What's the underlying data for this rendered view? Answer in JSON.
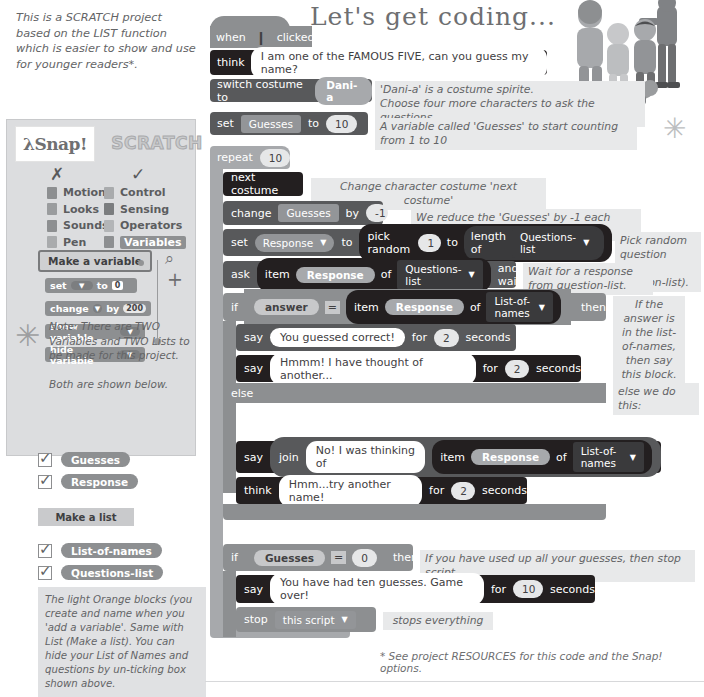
{
  "intro": {
    "text": "This is a SCRATCH project based on the LIST function which is easier to show and use for younger readers*."
  },
  "title": "Let's get coding...",
  "snap_panel": {
    "snap_logo": "λSnap!",
    "scratch_logo": "SCRATCH",
    "mark_x": "✗",
    "mark_tick": "✓",
    "categories_left": [
      {
        "label": "Motion",
        "color": "#8d8f91"
      },
      {
        "label": "Looks",
        "color": "#9a9c9e"
      },
      {
        "label": "Sounds",
        "color": "#8d8f91"
      },
      {
        "label": "Pen",
        "color": "#a9abad"
      }
    ],
    "categories_right": [
      {
        "label": "Control",
        "color": "#a9abad",
        "highlight": false
      },
      {
        "label": "Sensing",
        "color": "#7b7d7f",
        "highlight": false
      },
      {
        "label": "Operators",
        "color": "#b3b5b7",
        "highlight": false
      },
      {
        "label": "Variables",
        "color": "#8d8f91",
        "highlight": true
      }
    ],
    "make_a_variable": "Make a variable",
    "palette_blocks": [
      {
        "label": "set",
        "slot": true,
        "mid": "to",
        "value": "0",
        "rounded": false
      },
      {
        "label": "change",
        "slot": true,
        "mid": "by",
        "value": "200",
        "rounded": true
      },
      {
        "label": "show variable",
        "slot": false,
        "mid": "",
        "value": "",
        "rounded": false
      },
      {
        "label": "hide variable",
        "slot": false,
        "mid": "",
        "value": "",
        "rounded": false
      }
    ],
    "magnifier_icon": "⌕",
    "plus_icon": "+",
    "asterisk": "✳",
    "note": "Note: There are TWO Variables and TWO Lists to be made for this project.\n\nBoth are shown below."
  },
  "variables_list": [
    {
      "label": "Guesses",
      "checked": true
    },
    {
      "label": "Response",
      "checked": true
    }
  ],
  "make_a_list": "Make a list",
  "lists_list": [
    {
      "label": "List-of-names",
      "checked": true
    },
    {
      "label": "Questions-list",
      "checked": true
    }
  ],
  "orange_note": "The light Orange blocks (you create and name when you 'add a variable'. Same with List (Make a list). You can hide your List of Names and questions by un-ticking box shown above.",
  "script": {
    "hat": {
      "when": "when",
      "flag": "⚑",
      "clicked": "clicked"
    },
    "think1": {
      "label": "think",
      "text": "I am one of the FAMOUS FIVE, can you guess my name?"
    },
    "switch_costume": {
      "label": "switch costume to",
      "value": "Dani-a"
    },
    "set_guesses": {
      "label": "set",
      "var": "Guesses",
      "to": "to",
      "value": "10"
    },
    "repeat": {
      "label": "repeat",
      "value": "10"
    },
    "next_costume": {
      "label": "next costume"
    },
    "change_guesses": {
      "label": "change",
      "var": "Guesses",
      "by": "by",
      "value": "-1"
    },
    "set_response": {
      "label": "set",
      "var": "Response",
      "to": "to",
      "pick": "pick random",
      "from": "1",
      "mid": "to",
      "length_of": "length of",
      "list": "Questions-list"
    },
    "ask": {
      "label": "ask",
      "item": "item",
      "var": "Response",
      "of": "of",
      "list": "Questions-list",
      "and_wait": "and wait"
    },
    "if1": {
      "label": "if",
      "answer": "answer",
      "eq": "=",
      "item": "item",
      "var": "Response",
      "of": "of",
      "list": "List-of-names",
      "then": "then"
    },
    "say1": {
      "label": "say",
      "text": "You guessed correct!",
      "for": "for",
      "secs": "2",
      "seconds": "seconds"
    },
    "say2": {
      "label": "say",
      "text": "Hmmm! I have thought of another...",
      "for": "for",
      "secs": "2",
      "seconds": "seconds"
    },
    "else": {
      "label": "else"
    },
    "say3": {
      "label": "say",
      "join": "join",
      "text": "No! I was thinking of",
      "item": "item",
      "var": "Response",
      "of": "of",
      "list": "List-of-names"
    },
    "think2": {
      "label": "think",
      "text": "Hmm...try another name!",
      "for": "for",
      "secs": "2",
      "seconds": "seconds"
    },
    "if2": {
      "label": "if",
      "var": "Guesses",
      "eq": "=",
      "value": "0",
      "then": "then"
    },
    "say4": {
      "label": "say",
      "text": "You have had ten guesses. Game over!",
      "for": "for",
      "secs": "10",
      "seconds": "seconds"
    },
    "stop": {
      "label": "stop",
      "value": "this script"
    }
  },
  "annotations": {
    "costume": "'Dani-a' is a costume spirite.\nChoose four more characters to ask the questions.",
    "guesses_var": "A variable called 'Guesses' to start counting from 1 to 10",
    "repeat": "Repeat ten questions from our questions-list...",
    "next_costume": "Change character costume 'next costume'",
    "change_guesses": "We reduce the 'Guesses' by -1 each question",
    "pick_random": "Pick random question (from Qustion-list).",
    "ask": "Wait for a response from question-list.",
    "if_true": "If the answer is in the list-of-names, then say this block.",
    "else": "else we do this:",
    "if_guesses_zero": "If you have used up all your guesses, then stop script.",
    "stop": "stops everything",
    "asterisk": "✳"
  },
  "footnote": "* See project RESOURCES for this code and the Snap! options.",
  "colors": {
    "dark_block": "#231f20",
    "mid_block": "#58595b",
    "light_block": "#8d8f91",
    "very_light_block": "#a7a9ac",
    "note_bg": "#e8e9ea",
    "panel_bg": "#dcdddf",
    "text": "#636466"
  }
}
